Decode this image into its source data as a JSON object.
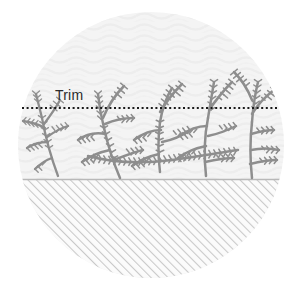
{
  "illustration": {
    "title": "Hedge trim guide diagram",
    "shape": "circle",
    "canvas": {
      "width": 301,
      "height": 290
    }
  },
  "labels": {
    "trim": "Trim"
  },
  "colors": {
    "circle_fill": "#f4f4f4",
    "circle_texture": "#ececec",
    "ground_line": "#b8b8b8",
    "ground_hatch": "#c9c9c9",
    "ground_fill": "#fbfbfb",
    "branch": "#8e8e8e",
    "branch_light": "#a6a6a6",
    "trim_line": "#1a1a1a",
    "trim_label": "#2b2b2b",
    "page_background": "#ffffff"
  },
  "geometry": {
    "circle_center_x": 151,
    "circle_center_y": 145,
    "circle_radius": 133,
    "trim_line_y": 108,
    "trim_line_x_start": 22,
    "trim_line_x_end": 279,
    "ground_line_y": 179,
    "trim_label_x": 55,
    "trim_label_y": 100
  },
  "icons": {
    "trim_guideline": "dotted-line-icon",
    "ground": "hatched-ground-icon",
    "plant": "shrub-branch-icon"
  }
}
